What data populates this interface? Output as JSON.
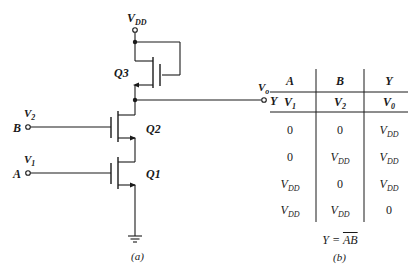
{
  "figure_a": {
    "caption": "(a)",
    "supply": {
      "label": "V",
      "sub": "DD"
    },
    "transistors": [
      {
        "name": "Q3",
        "role": "load"
      },
      {
        "name": "Q2",
        "role": "driver-top"
      },
      {
        "name": "Q1",
        "role": "driver-bottom"
      }
    ],
    "inputs": [
      {
        "terminal": "B",
        "voltage": "V",
        "sub": "2",
        "transistor": "Q2"
      },
      {
        "terminal": "A",
        "voltage": "V",
        "sub": "1",
        "transistor": "Q1"
      }
    ],
    "output": {
      "terminal": "Y",
      "voltage": "V",
      "sub": "o"
    },
    "ground": "ground"
  },
  "figure_b": {
    "caption": "(b)",
    "headers": [
      "A",
      "B",
      "Y"
    ],
    "voltage_row": [
      {
        "v": "V",
        "sub": "1"
      },
      {
        "v": "V",
        "sub": "2"
      },
      {
        "v": "V",
        "sub": "0"
      }
    ],
    "rows": [
      [
        {
          "v": "0",
          "sub": ""
        },
        {
          "v": "0",
          "sub": ""
        },
        {
          "v": "V",
          "sub": "DD"
        }
      ],
      [
        {
          "v": "0",
          "sub": ""
        },
        {
          "v": "V",
          "sub": "DD"
        },
        {
          "v": "V",
          "sub": "DD"
        }
      ],
      [
        {
          "v": "V",
          "sub": "DD"
        },
        {
          "v": "0",
          "sub": ""
        },
        {
          "v": "V",
          "sub": "DD"
        }
      ],
      [
        {
          "v": "V",
          "sub": "DD"
        },
        {
          "v": "V",
          "sub": "DD"
        },
        {
          "v": "0",
          "sub": ""
        }
      ]
    ],
    "formula": {
      "lhs": "Y",
      "eq": "=",
      "rhs": "AB",
      "rhs_overbar": true
    }
  }
}
